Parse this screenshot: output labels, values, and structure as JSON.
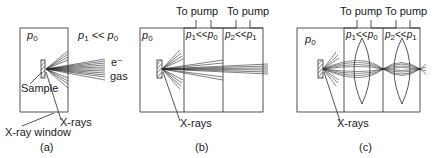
{
  "figure": {
    "panels": [
      {
        "id": "a",
        "caption": "(a)",
        "chamber_pressure": {
          "symbol": "p",
          "sub": "0"
        },
        "outside_pressure": {
          "lhs_symbol": "p",
          "lhs_sub": "1",
          "op": "<<",
          "rhs_symbol": "p",
          "rhs_sub": "0"
        },
        "electron_label": "e⁻",
        "gas_label": "gas",
        "sample_label": "Sample",
        "xray_label": "X-rays",
        "window_label": "X-ray window"
      },
      {
        "id": "b",
        "caption": "(b)",
        "chamber_pressure": {
          "symbol": "p",
          "sub": "0"
        },
        "stage1_pressure": {
          "lhs_symbol": "p",
          "lhs_sub": "1",
          "op": "<<",
          "rhs_symbol": "p",
          "rhs_sub": "0"
        },
        "stage2_pressure": {
          "lhs_symbol": "p",
          "lhs_sub": "2",
          "op": "<<",
          "rhs_symbol": "p",
          "rhs_sub": "1"
        },
        "pump1_label": "To pump",
        "pump2_label": "To pump",
        "xray_label": "X-rays"
      },
      {
        "id": "c",
        "caption": "(c)",
        "chamber_pressure": {
          "symbol": "p",
          "sub": "0"
        },
        "stage1_pressure": {
          "lhs_symbol": "p",
          "lhs_sub": "1",
          "op": "<<",
          "rhs_symbol": "p",
          "rhs_sub": "0"
        },
        "stage2_pressure": {
          "lhs_symbol": "p",
          "lhs_sub": "2",
          "op": "<<",
          "rhs_symbol": "p",
          "rhs_sub": "1"
        },
        "pump1_label": "To pump",
        "pump2_label": "To pump",
        "xray_label": "X-rays"
      }
    ],
    "colors": {
      "line": "#2a2a2a",
      "text": "#1a1a1a",
      "background": "#ffffff"
    }
  }
}
